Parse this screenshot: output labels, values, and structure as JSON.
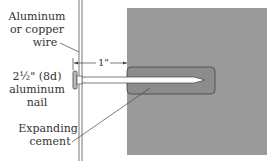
{
  "colors": {
    "block": "#9a9a9a",
    "hole": "#8c8c8c",
    "line": "#333333",
    "nail": "#ffffff"
  },
  "labels": {
    "wire": [
      "Aluminum",
      "or copper",
      "wire"
    ],
    "nail": [
      "2½\" (8d)",
      "aluminum",
      "nail"
    ],
    "cement": [
      "Expanding",
      "cement"
    ],
    "dimension": "1\""
  }
}
